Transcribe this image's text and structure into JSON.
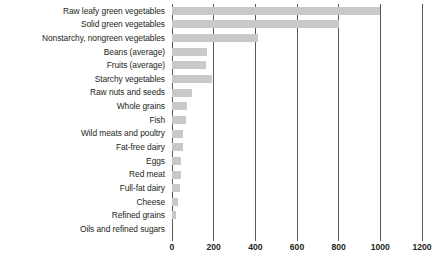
{
  "chart_data": {
    "type": "bar",
    "orientation": "horizontal",
    "title": "",
    "xlabel": "",
    "ylabel": "",
    "xlim": [
      0,
      1200
    ],
    "xticks": [
      0,
      200,
      400,
      600,
      800,
      1000,
      1200
    ],
    "xtick_labels": [
      "0",
      "200",
      "400",
      "600",
      "800",
      "1000",
      "1200"
    ],
    "grid": true,
    "legend": false,
    "bar_color": "#c9c9c9",
    "axis_color": "#58595b",
    "text_color": "#231f20",
    "categories": [
      "Raw leafy green vegetables",
      "Solid green vegetables",
      "Nonstarchy, nongreen vegetables",
      "Beans (average)",
      "Fruits (average)",
      "Starchy vegetables",
      "Raw nuts and seeds",
      "Whole grains",
      "Fish",
      "Wild meats and poultry",
      "Fat-free dairy",
      "Eggs",
      "Red meat",
      "Full-fat dairy",
      "Cheese",
      "Oils and refined sugars"
    ],
    "values": [
      1000,
      800,
      415,
      170,
      165,
      190,
      95,
      70,
      65,
      55,
      50,
      45,
      42,
      35,
      30,
      0
    ],
    "extra_categories": [
      "Refined grains"
    ],
    "notes": ""
  },
  "chart_rows": [
    {
      "label": "Raw leafy green vegetables",
      "value": 1000
    },
    {
      "label": "Solid green vegetables",
      "value": 800
    },
    {
      "label": "Nonstarchy, nongreen vegetables",
      "value": 415
    },
    {
      "label": "Beans (average)",
      "value": 170
    },
    {
      "label": "Fruits (average)",
      "value": 165
    },
    {
      "label": "Starchy vegetables",
      "value": 190
    },
    {
      "label": "Raw nuts and seeds",
      "value": 95
    },
    {
      "label": "Whole grains",
      "value": 70
    },
    {
      "label": "Fish",
      "value": 65
    },
    {
      "label": "Wild meats and poultry",
      "value": 55
    },
    {
      "label": "Fat-free dairy",
      "value": 52
    },
    {
      "label": "Eggs",
      "value": 45
    },
    {
      "label": "Red meat",
      "value": 42
    },
    {
      "label": "Full-fat dairy",
      "value": 36
    },
    {
      "label": "Cheese",
      "value": 30
    },
    {
      "label": "Refined grains",
      "value": 18
    },
    {
      "label": "Oils and refined sugars",
      "value": 0
    }
  ],
  "axis": {
    "ticks": [
      {
        "value": 0,
        "label": "0"
      },
      {
        "value": 200,
        "label": "200"
      },
      {
        "value": 400,
        "label": "400"
      },
      {
        "value": 600,
        "label": "600"
      },
      {
        "value": 800,
        "label": "800"
      },
      {
        "value": 1000,
        "label": "1000"
      },
      {
        "value": 1200,
        "label": "1200"
      }
    ],
    "max": 1200
  }
}
